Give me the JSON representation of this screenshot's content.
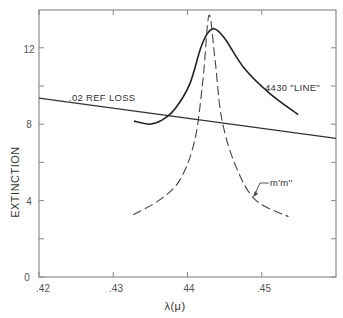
{
  "chart_data": {
    "type": "line",
    "title": "",
    "xlabel": "λ(μ)",
    "ylabel": "EXTINCTION",
    "xlim": [
      0.42,
      0.46
    ],
    "ylim": [
      0,
      14
    ],
    "grid": false,
    "x_ticks": [
      {
        "value": 0.42,
        "label": ".42"
      },
      {
        "value": 0.43,
        "label": ".43"
      },
      {
        "value": 0.44,
        "label": "44"
      },
      {
        "value": 0.45,
        "label": ".45"
      }
    ],
    "y_ticks": [
      {
        "value": 0,
        "label": "0"
      },
      {
        "value": 2,
        "label": ""
      },
      {
        "value": 4,
        "label": "4"
      },
      {
        "value": 6,
        "label": ""
      },
      {
        "value": 8,
        "label": "8"
      },
      {
        "value": 10,
        "label": ""
      },
      {
        "value": 12,
        "label": "12"
      }
    ],
    "series": [
      {
        "name": ".02 REF LOSS",
        "style": "solid",
        "x": [
          0.42,
          0.46
        ],
        "y": [
          9.37,
          7.26
        ]
      },
      {
        "name": "4430 \"LINE\"",
        "style": "solid",
        "x": [
          0.4328,
          0.4349,
          0.4365,
          0.4383,
          0.4403,
          0.4417,
          0.4426,
          0.4436,
          0.445,
          0.4477,
          0.4511,
          0.4549
        ],
        "y": [
          8.16,
          8.0,
          8.2,
          8.8,
          10.1,
          11.9,
          12.7,
          13.0,
          12.5,
          10.9,
          9.6,
          8.5
        ]
      },
      {
        "name": "m'm''",
        "style": "dashed",
        "x": [
          0.4327,
          0.4363,
          0.439,
          0.441,
          0.4421,
          0.4429,
          0.4437,
          0.4446,
          0.4464,
          0.4491,
          0.4536
        ],
        "y": [
          3.26,
          4.05,
          5.1,
          7.2,
          10.4,
          13.7,
          11.4,
          8.3,
          5.9,
          4.05,
          3.16
        ]
      }
    ],
    "annotations": [
      {
        "text": ".02 REF LOSS",
        "x": 0.4262,
        "y": 9.5
      },
      {
        "text": "4430 \"LINE\"",
        "x": 0.4502,
        "y": 9.9
      },
      {
        "text": "m'm''",
        "x": 0.4503,
        "y": 5.6
      }
    ],
    "legend": "none (inline annotations)"
  },
  "labels": {
    "ref_loss": ".02 REF LOSS",
    "line_4430": "4430 \"LINE\"",
    "mm": "m'm''",
    "x_axis_title": "λ(μ)",
    "y_axis_title": "EXTINCTION",
    "x_ticks": [
      ".42",
      ".43",
      "44",
      ".45"
    ],
    "y_ticks": [
      "0",
      "4",
      "8",
      "12"
    ]
  }
}
